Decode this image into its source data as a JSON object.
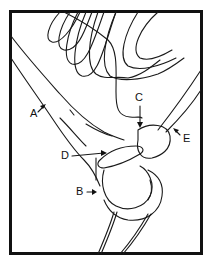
{
  "figure": {
    "labels": [
      {
        "id": "A",
        "text": "A"
      },
      {
        "id": "B",
        "text": "B"
      },
      {
        "id": "C",
        "text": "C"
      },
      {
        "id": "D",
        "text": "D"
      },
      {
        "id": "E",
        "text": "E"
      }
    ]
  }
}
